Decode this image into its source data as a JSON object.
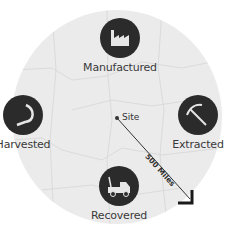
{
  "map": {
    "background_color": "#ebebeb",
    "icon_color": "#2b2b2b",
    "site_label": "Site",
    "scale_label": "500 Miles"
  },
  "nodes": [
    {
      "label": "Manufactured",
      "icon": "factory-icon"
    },
    {
      "label": "Harvested",
      "icon": "sickle-icon"
    },
    {
      "label": "Extracted",
      "icon": "pickaxe-icon"
    },
    {
      "label": "Recovered",
      "icon": "tow-truck-icon"
    }
  ]
}
